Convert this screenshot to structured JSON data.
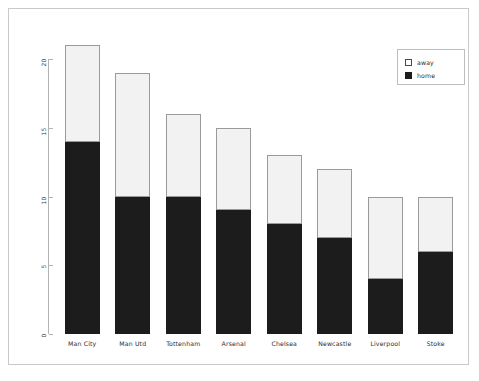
{
  "chart_data": {
    "type": "bar",
    "subtype": "stacked-bar",
    "title": "",
    "xlabel": "",
    "ylabel": "",
    "categories": [
      "Man City",
      "Man Utd",
      "Tottenham",
      "Arsenal",
      "Chelsea",
      "Newcastle",
      "Liverpool",
      "Stoke"
    ],
    "series": [
      {
        "name": "home",
        "color": "#1c1c1c",
        "values": [
          14,
          10,
          10,
          9,
          8,
          7,
          4,
          6
        ]
      },
      {
        "name": "away",
        "color": "#f2f2f2",
        "values": [
          7,
          9,
          6,
          6,
          5,
          5,
          6,
          4
        ]
      }
    ],
    "totals": [
      21,
      19,
      16,
      15,
      13,
      12,
      10,
      10
    ],
    "ylim": [
      0,
      21.5
    ],
    "yticks": [
      0,
      5,
      10,
      15,
      20
    ],
    "ytick_labels": [
      "0",
      "5",
      "10",
      "15",
      "20"
    ],
    "grid": false,
    "legend": {
      "position": "top-right",
      "entries": [
        {
          "label": "away",
          "swatch": "white-square"
        },
        {
          "label": "home",
          "swatch": "black-square"
        }
      ]
    },
    "stack_order_bottom_to_top": [
      "home",
      "away"
    ],
    "background_color": "#ffffff",
    "frame_color": "#c9c9c9",
    "axis_color": "#b4b4b4"
  }
}
